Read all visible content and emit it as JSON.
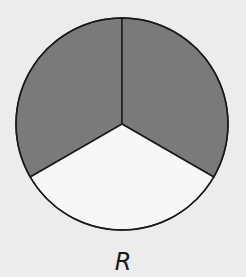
{
  "figure": {
    "label": "R",
    "circle": {
      "total_parts": 3,
      "shaded_parts": 2,
      "unshaded_parts": 1
    },
    "colors": {
      "background": "#ececec",
      "shaded": "#7a7a7a",
      "unshaded": "#f7f7f7",
      "stroke": "#1a1a1a"
    },
    "sectors": [
      {
        "name": "upper-left",
        "shaded": true
      },
      {
        "name": "upper-right",
        "shaded": true
      },
      {
        "name": "bottom",
        "shaded": false
      }
    ]
  }
}
